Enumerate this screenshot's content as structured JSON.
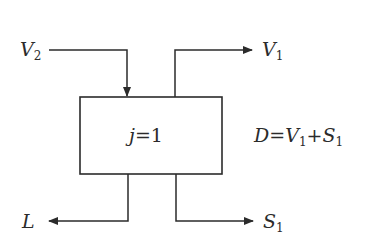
{
  "diagram": {
    "type": "stage-flow-block",
    "stage": {
      "label_var": "j",
      "label_op": "=",
      "label_val": "1"
    },
    "streams": {
      "v2": {
        "name": "V",
        "sub": "2",
        "direction": "in"
      },
      "v1": {
        "name": "V",
        "sub": "1",
        "direction": "out"
      },
      "l": {
        "name": "L",
        "sub": "",
        "direction": "out"
      },
      "s1": {
        "name": "S",
        "sub": "1",
        "direction": "out"
      }
    },
    "equation": {
      "lhs": "D",
      "eq": "=",
      "t1": "V",
      "t1_sub": "1",
      "plus": "+",
      "t2": "S",
      "t2_sub": "1"
    },
    "colors": {
      "line": "#2b2b2b",
      "background": "#ffffff"
    }
  }
}
